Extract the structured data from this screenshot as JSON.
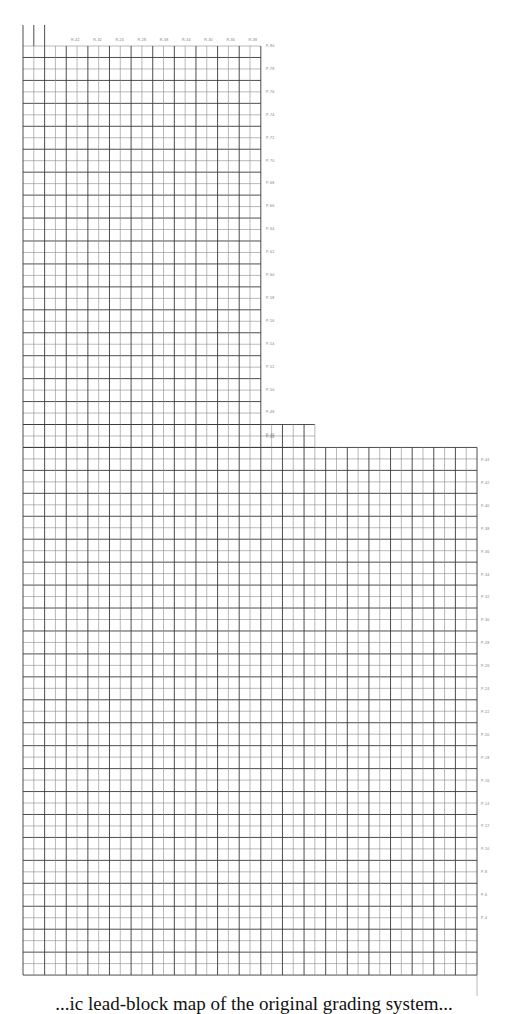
{
  "figure": {
    "type": "grid-map",
    "line_color": "#3a3a3a",
    "line_color_light": "#8a8a8a",
    "grid": {
      "x0": 23,
      "y0": 46,
      "cell_w": 10.81,
      "cell_h": 11.47,
      "sections": [
        {
          "name": "upper",
          "col_start": 0,
          "col_end": 22,
          "row_start": 0,
          "row_end": 33
        },
        {
          "name": "step",
          "col_start": 0,
          "col_end": 27,
          "row_start": 33,
          "row_end": 35
        },
        {
          "name": "lower",
          "col_start": 0,
          "col_end": 42,
          "row_start": 35,
          "row_end": 81
        }
      ],
      "top_extension": {
        "cols": [
          0,
          1,
          2
        ],
        "y_top": 25
      },
      "right_extension": {
        "col": 42,
        "y_bottom": 996
      }
    },
    "top_labels": {
      "y": 41,
      "x_start": 75,
      "x_step": 22.2,
      "items": [
        "R-42",
        "R-32",
        "R-24",
        "R-28",
        "R-38",
        "R-34",
        "R-30",
        "R-36",
        "R-38"
      ]
    },
    "upper_right_labels": {
      "x": 266,
      "y_start": 47,
      "y_step": 22.9,
      "items": [
        "P-80",
        "P-78",
        "P-76",
        "P-74",
        "P-72",
        "P-70",
        "P-68",
        "P-66",
        "P-64",
        "P-62",
        "P-60",
        "P-58",
        "P-56",
        "P-54",
        "P-52",
        "P-50",
        "P-48",
        "P-46"
      ]
    },
    "step_label": {
      "x": 266,
      "y": 438,
      "text": "P-46"
    },
    "lower_right_labels": {
      "x": 481,
      "y_start": 461,
      "y_step": 22.9,
      "items": [
        "P-44",
        "P-42",
        "P-40",
        "P-38",
        "P-36",
        "P-34",
        "P-32",
        "P-30",
        "P-28",
        "P-26",
        "P-24",
        "P-22",
        "P-20",
        "P-18",
        "P-16",
        "P-14",
        "P-12",
        "P-10",
        "P-8",
        "P-6",
        "P-4"
      ]
    }
  },
  "caption": {
    "text": "...ic lead-block map of the original grading system..."
  }
}
